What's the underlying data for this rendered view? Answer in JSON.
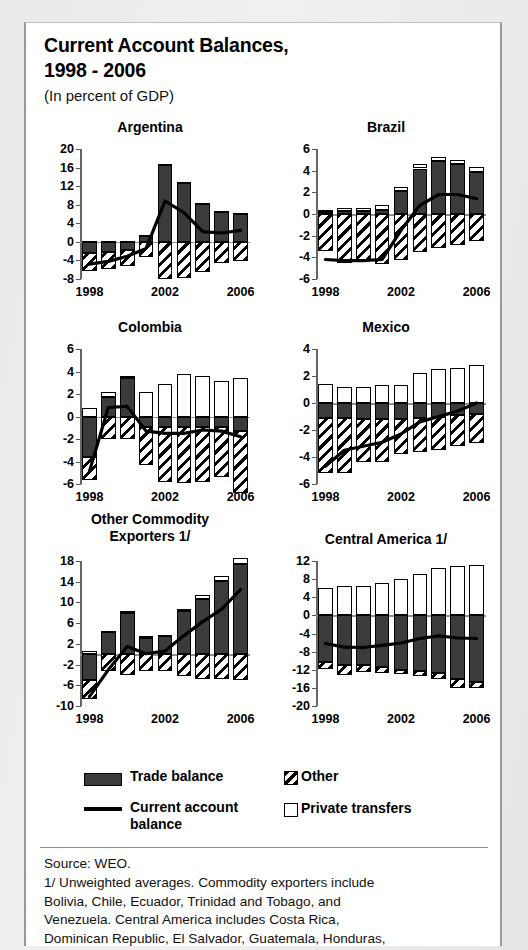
{
  "header": {
    "title": "Current Account Balances,\n1998 - 2006",
    "subtitle": "(In percent of GDP)"
  },
  "legend": {
    "trade_label": "Trade balance",
    "current_account_label": "Current account\nbalance",
    "other_label": "Other",
    "private_transfers_label": "Private transfers"
  },
  "footer": {
    "source": "Source: WEO.",
    "note": "1/ Unweighted averages. Commodity exporters include\nBolivia, Chile, Ecuador, Trinidad and Tobago, and\nVenezuela. Central America includes Costa Rica,\nDominican Republic, El Salvador, Guatemala, Honduras,\nNicaragua, and Panama."
  },
  "chart_data": [
    {
      "type": "bar",
      "title": "Argentina",
      "xlabel": "",
      "ylabel": "",
      "x": [
        1998,
        1999,
        2000,
        2001,
        2002,
        2003,
        2004,
        2005,
        2006
      ],
      "xtick_labels": [
        "1998",
        "2002",
        "2006"
      ],
      "xtick_positions": [
        1998,
        2002,
        2006
      ],
      "ylim": [
        -8,
        20
      ],
      "yticks": [
        -8,
        -4,
        0,
        4,
        8,
        12,
        16,
        20
      ],
      "ytick_labels": [
        "-8",
        "-4",
        "0",
        "4",
        "8",
        "12",
        "16",
        "20"
      ],
      "grid": false,
      "legend_position": "external",
      "series": [
        {
          "name": "Trade balance",
          "values": [
            -2.4,
            -2.2,
            -1.7,
            1.4,
            16.6,
            12.6,
            8.1,
            6.4,
            6.1
          ]
        },
        {
          "name": "Private transfers",
          "values": [
            0.1,
            0.1,
            0.1,
            0.1,
            0.2,
            0.2,
            0.2,
            0.2,
            0.2
          ]
        },
        {
          "name": "Other",
          "values": [
            -3.9,
            -3.6,
            -3.6,
            -3.2,
            -8.0,
            -7.8,
            -6.5,
            -4.5,
            -4.2
          ]
        },
        {
          "name": "Current account balance",
          "values": [
            -4.8,
            -4.2,
            -3.1,
            -1.4,
            8.8,
            6.3,
            2.2,
            1.9,
            2.5
          ]
        }
      ]
    },
    {
      "type": "bar",
      "title": "Brazil",
      "xlabel": "",
      "ylabel": "",
      "x": [
        1998,
        1999,
        2000,
        2001,
        2002,
        2003,
        2004,
        2005,
        2006
      ],
      "xtick_labels": [
        "1998",
        "2002",
        "2006"
      ],
      "xtick_positions": [
        1998,
        2002,
        2006
      ],
      "ylim": [
        -6,
        6
      ],
      "yticks": [
        -6,
        -4,
        -2,
        0,
        2,
        4,
        6
      ],
      "ytick_labels": [
        "-6",
        "-4",
        "-2",
        "0",
        "2",
        "4",
        "6"
      ],
      "grid": false,
      "legend_position": "external",
      "series": [
        {
          "name": "Trade balance",
          "values": [
            0.2,
            0.3,
            0.3,
            0.4,
            2.1,
            4.2,
            4.9,
            4.6,
            3.9
          ]
        },
        {
          "name": "Private transfers",
          "values": [
            0.2,
            0.3,
            0.3,
            0.4,
            0.4,
            0.4,
            0.4,
            0.4,
            0.4
          ]
        },
        {
          "name": "Other",
          "values": [
            -3.4,
            -4.5,
            -4.2,
            -4.6,
            -4.2,
            -3.5,
            -3.1,
            -2.9,
            -2.5
          ]
        },
        {
          "name": "Current account balance",
          "values": [
            -4.2,
            -4.3,
            -4.3,
            -4.2,
            -1.5,
            0.8,
            1.8,
            1.8,
            1.4
          ]
        }
      ]
    },
    {
      "type": "bar",
      "title": "Colombia",
      "xlabel": "",
      "ylabel": "",
      "x": [
        1998,
        1999,
        2000,
        2001,
        2002,
        2003,
        2004,
        2005,
        2006
      ],
      "xtick_labels": [
        "1998",
        "2002",
        "2006"
      ],
      "xtick_positions": [
        1998,
        2002,
        2006
      ],
      "ylim": [
        -6,
        6
      ],
      "yticks": [
        -6,
        -4,
        -2,
        0,
        2,
        4,
        6
      ],
      "ytick_labels": [
        "-6",
        "-4",
        "-2",
        "0",
        "2",
        "4",
        "6"
      ],
      "grid": false,
      "legend_position": "external",
      "series": [
        {
          "name": "Trade balance",
          "values": [
            -3.6,
            1.7,
            3.4,
            -0.9,
            -0.9,
            -0.9,
            -0.9,
            -0.9,
            -1.3
          ]
        },
        {
          "name": "Private transfers",
          "values": [
            0.8,
            0.5,
            0.2,
            2.2,
            2.9,
            3.8,
            3.6,
            3.2,
            3.4
          ]
        },
        {
          "name": "Other",
          "values": [
            -2.0,
            -2.0,
            -2.0,
            -3.4,
            -4.9,
            -5.0,
            -4.9,
            -4.5,
            -5.5
          ]
        },
        {
          "name": "Current account balance",
          "values": [
            -4.9,
            0.8,
            0.9,
            -1.3,
            -1.5,
            -1.5,
            -1.2,
            -1.3,
            -1.8
          ]
        }
      ]
    },
    {
      "type": "bar",
      "title": "Mexico",
      "xlabel": "",
      "ylabel": "",
      "x": [
        1998,
        1999,
        2000,
        2001,
        2002,
        2003,
        2004,
        2005,
        2006
      ],
      "xtick_labels": [
        "1998",
        "2002",
        "2006"
      ],
      "xtick_positions": [
        1998,
        2002,
        2006
      ],
      "ylim": [
        -6,
        4
      ],
      "yticks": [
        -6,
        -4,
        -2,
        0,
        2,
        4
      ],
      "ytick_labels": [
        "-6",
        "-4",
        "-2",
        "0",
        "2",
        "4"
      ],
      "grid": false,
      "legend_position": "external",
      "series": [
        {
          "name": "Trade balance",
          "values": [
            -1.1,
            -1.1,
            -1.2,
            -1.2,
            -1.2,
            -1.1,
            -1.0,
            -0.9,
            -0.8
          ]
        },
        {
          "name": "Private transfers",
          "values": [
            1.4,
            1.2,
            1.2,
            1.3,
            1.3,
            2.2,
            2.5,
            2.6,
            2.8
          ]
        },
        {
          "name": "Other",
          "values": [
            -4.1,
            -4.1,
            -3.2,
            -3.2,
            -2.6,
            -2.5,
            -2.5,
            -2.3,
            -2.2
          ]
        },
        {
          "name": "Current account balance",
          "values": [
            -4.7,
            -3.5,
            -3.2,
            -2.9,
            -2.3,
            -1.4,
            -1.0,
            -0.6,
            0.0
          ]
        }
      ]
    },
    {
      "type": "bar",
      "title": "Other Commodity\nExporters 1/",
      "xlabel": "",
      "ylabel": "",
      "x": [
        1998,
        1999,
        2000,
        2001,
        2002,
        2003,
        2004,
        2005,
        2006
      ],
      "xtick_labels": [
        "1998",
        "2002",
        "2006"
      ],
      "xtick_positions": [
        1998,
        2002,
        2006
      ],
      "ylim": [
        -10,
        18
      ],
      "yticks": [
        -10,
        -6,
        -2,
        2,
        6,
        10,
        14,
        18
      ],
      "ytick_labels": [
        "-10",
        "-6",
        "-2",
        "2",
        "6",
        "10",
        "14",
        "18"
      ],
      "grid": false,
      "legend_position": "external",
      "series": [
        {
          "name": "Trade balance",
          "values": [
            -5.0,
            4.2,
            8.0,
            3.2,
            3.5,
            8.3,
            10.6,
            14.1,
            17.4
          ]
        },
        {
          "name": "Private transfers",
          "values": [
            0.6,
            0.3,
            0.3,
            0.3,
            0.3,
            0.5,
            0.8,
            1.0,
            1.1
          ]
        },
        {
          "name": "Other",
          "values": [
            -3.6,
            -3.2,
            -4.0,
            -3.2,
            -3.3,
            -4.2,
            -4.7,
            -4.8,
            -5.0
          ]
        },
        {
          "name": "Current account balance",
          "values": [
            -8.2,
            -3.0,
            1.5,
            0.1,
            0.6,
            3.6,
            6.3,
            8.7,
            12.5
          ]
        }
      ]
    },
    {
      "type": "bar",
      "title": "Central America 1/",
      "xlabel": "",
      "ylabel": "",
      "x": [
        1998,
        1999,
        2000,
        2001,
        2002,
        2003,
        2004,
        2005,
        2006
      ],
      "xtick_labels": [
        "1998",
        "2002",
        "2006"
      ],
      "xtick_positions": [
        1998,
        2002,
        2006
      ],
      "ylim": [
        -20,
        12
      ],
      "yticks": [
        -20,
        -16,
        -12,
        -8,
        -4,
        0,
        4,
        8,
        12
      ],
      "ytick_labels": [
        "-20",
        "-16",
        "-12",
        "-8",
        "-4",
        "0",
        "4",
        "8",
        "12"
      ],
      "grid": false,
      "legend_position": "external",
      "series": [
        {
          "name": "Trade balance",
          "values": [
            -10.3,
            -11.0,
            -11.0,
            -11.3,
            -12.1,
            -12.3,
            -12.8,
            -14.1,
            -14.7
          ]
        },
        {
          "name": "Private transfers",
          "values": [
            6.0,
            6.4,
            6.5,
            7.2,
            8.1,
            9.2,
            10.4,
            10.8,
            11.2
          ]
        },
        {
          "name": "Other",
          "values": [
            -1.6,
            -2.1,
            -1.6,
            -1.5,
            -0.9,
            -1.0,
            -1.2,
            -1.9,
            -1.4
          ]
        },
        {
          "name": "Current account balance",
          "values": [
            -6.2,
            -7.0,
            -7.1,
            -6.6,
            -6.1,
            -5.1,
            -4.5,
            -5.0,
            -5.1
          ]
        }
      ]
    }
  ]
}
